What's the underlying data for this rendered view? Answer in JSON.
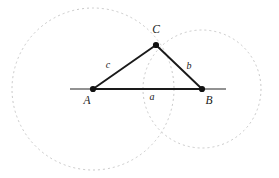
{
  "figure": {
    "background_color": "#ffffff",
    "width": 279,
    "height": 178,
    "stroke_colors": {
      "triangle": "#1a1a1a",
      "baseline": "#6e6e6e",
      "circle_dashed": "#c9c9c9",
      "point_fill": "#111111",
      "label": "#1a1a1a"
    }
  },
  "vertices": [
    {
      "id": "A",
      "label": "A",
      "x": 93,
      "y": 89,
      "label_x": 87,
      "label_y": 104
    },
    {
      "id": "B",
      "label": "B",
      "x": 202,
      "y": 89,
      "label_x": 207,
      "label_y": 104
    },
    {
      "id": "C",
      "label": "C",
      "x": 156,
      "y": 45,
      "label_x": 152,
      "label_y": 33
    }
  ],
  "sides": [
    {
      "id": "a",
      "label": "a",
      "from": "A",
      "to": "B",
      "label_x": 148,
      "label_y": 100
    },
    {
      "id": "b",
      "label": "b",
      "from": "C",
      "to": "B",
      "label_x": 185,
      "label_y": 69
    },
    {
      "id": "c",
      "label": "c",
      "from": "A",
      "to": "C",
      "label_x": 105,
      "label_y": 68
    }
  ],
  "baseline": {
    "id": "baseline",
    "x1": 70,
    "y1": 89,
    "x2": 226,
    "y2": 89
  },
  "circles": [
    {
      "id": "circle-A",
      "center": "A",
      "cx": 93,
      "cy": 89,
      "r": 81
    },
    {
      "id": "circle-B",
      "center": "B",
      "cx": 202,
      "cy": 89,
      "r": 59
    }
  ],
  "dash_pattern": "2,3",
  "point_radius": 3.1
}
